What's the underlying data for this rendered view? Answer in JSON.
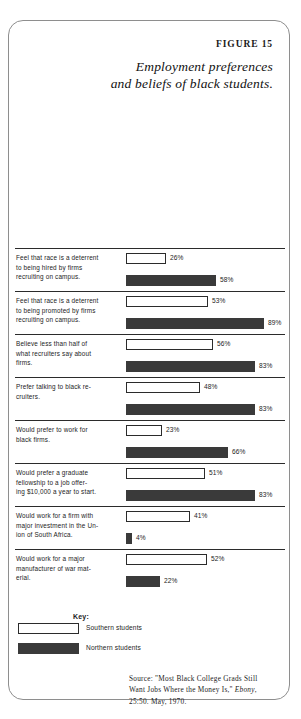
{
  "figure": {
    "number": "FIGURE 15",
    "title_line1": "Employment preferences",
    "title_line2": "and beliefs of black students."
  },
  "legend": {
    "title": "Key:",
    "items": [
      {
        "swatch": "south",
        "label": "Southern students"
      },
      {
        "swatch": "north",
        "label": "Northern students"
      }
    ]
  },
  "source": {
    "line1": "Source: \"Most Black College Grads Still",
    "line2_a": "Want Jobs Where the Money Is,\" ",
    "line2_italic": "Ebony",
    "line2_b": ",",
    "line3": "25:50. May, 1970."
  },
  "colors": {
    "south_fill": "#ffffff",
    "north_fill": "#3a3a3a",
    "rule": "#2b2b2b",
    "border": "#8e8e8e",
    "text": "#1c1c1c"
  },
  "chart_data": {
    "type": "bar",
    "title": "Employment preferences and beliefs of black students.",
    "xlabel": "",
    "ylabel": "",
    "xlim": [
      0,
      100
    ],
    "grid": false,
    "legend_position": "bottom-left",
    "orientation": "horizontal",
    "value_unit": "%",
    "categories": [
      "Feel that race is a deterrent to being hired by firms recruiting on campus.",
      "Feel that race is a deterrent to being promoted by firms recruiting on campus.",
      "Believe less than half of what recruiters say about firms.",
      "Prefer talking to black recruiters.",
      "Would prefer to work for black firms.",
      "Would prefer a graduate fellowship to a job offering $10,000 a year to start.",
      "Would work for a firm with major investment in the Union of South Africa.",
      "Would work for a major manufacturer of war material."
    ],
    "series": [
      {
        "name": "Southern students",
        "values": [
          26,
          53,
          56,
          48,
          23,
          51,
          41,
          52
        ]
      },
      {
        "name": "Northern students",
        "values": [
          58,
          89,
          83,
          83,
          66,
          83,
          4,
          22
        ]
      }
    ]
  },
  "rows": [
    {
      "label_lines": [
        "Feel that race is a deterrent",
        "to being hired by firms",
        "recruiting on campus."
      ],
      "south": {
        "value": 26,
        "value_text": "26%"
      },
      "north": {
        "value": 58,
        "value_text": "58%"
      }
    },
    {
      "label_lines": [
        "Feel that race is a deterrent",
        "to being promoted by firms",
        "recruiting on campus."
      ],
      "south": {
        "value": 53,
        "value_text": "53%"
      },
      "north": {
        "value": 89,
        "value_text": "89%"
      }
    },
    {
      "label_lines": [
        "Believe less than half of",
        "what recruiters say about",
        "firms."
      ],
      "south": {
        "value": 56,
        "value_text": "56%"
      },
      "north": {
        "value": 83,
        "value_text": "83%"
      }
    },
    {
      "label_lines": [
        "Prefer talking to black re-",
        "cruiters."
      ],
      "south": {
        "value": 48,
        "value_text": "48%"
      },
      "north": {
        "value": 83,
        "value_text": "83%"
      }
    },
    {
      "label_lines": [
        "Would prefer to work for",
        "black firms."
      ],
      "south": {
        "value": 23,
        "value_text": "23%"
      },
      "north": {
        "value": 66,
        "value_text": "66%"
      }
    },
    {
      "label_lines": [
        "Would prefer a graduate",
        "fellowship to a job offer-",
        "ing $10,000 a year to start."
      ],
      "south": {
        "value": 51,
        "value_text": "51%"
      },
      "north": {
        "value": 83,
        "value_text": "83%"
      }
    },
    {
      "label_lines": [
        "Would work for a firm with",
        "major investment in the Un-",
        "ion of South Africa."
      ],
      "south": {
        "value": 41,
        "value_text": "41%"
      },
      "north": {
        "value": 4,
        "value_text": "4%"
      }
    },
    {
      "label_lines": [
        "Would work for a major",
        "manufacturer of war mat-",
        "erial."
      ],
      "south": {
        "value": 52,
        "value_text": "52%"
      },
      "north": {
        "value": 22,
        "value_text": "22%"
      }
    }
  ]
}
